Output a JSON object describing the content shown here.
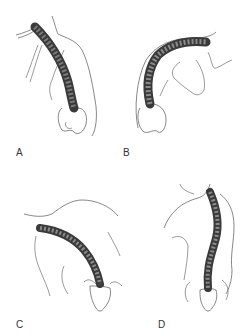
{
  "figure": {
    "panels": [
      {
        "label": "A",
        "description": "Posterior view, upper trunk, spine curving convex left over the pelvis"
      },
      {
        "label": "B",
        "description": "Forward-bending trunk, spine arching over toward the shoulder"
      },
      {
        "label": "C",
        "description": "Trunk bending laterally, spine curving from shoulder to sacrum"
      },
      {
        "label": "D",
        "description": "Standing posterior view, S-shaped spinal curve above sacrum"
      }
    ],
    "colors": {
      "line": "#555555",
      "spine_fill": "#6b6b6b",
      "spine_dark": "#3a3a3a",
      "background": "#ffffff"
    }
  }
}
